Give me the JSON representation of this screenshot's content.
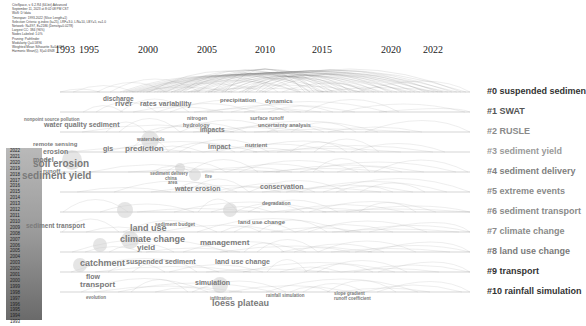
{
  "header": {
    "lines": [
      "CiteSpace, v. 6.2.R4 (64-bit) Advanced",
      "September 11, 2023 at 8:02:08 PM CST",
      "WoS: D:\\data",
      "Timespan: 1993-2022 (Slice Length=1)",
      "Selection Criteria: g-index (k=25), LRF=3.0, L/N=10, LBY=5, e=1.0",
      "Network: N=397, E=2186 (Density=0.0278)",
      "Largest CC: 384 (96%)",
      "Nodes Labeled: 1.0%",
      "Pruning: Pathfinder",
      "Modularity Q=0.5896",
      "Weighted Mean Silhouette S=0.8457",
      "Harmonic Mean(Q, S)=0.6948"
    ]
  },
  "timeline": {
    "years": [
      {
        "label": "1993",
        "x": 65
      },
      {
        "label": "1995",
        "x": 89
      },
      {
        "label": "2000",
        "x": 148
      },
      {
        "label": "2005",
        "x": 207
      },
      {
        "label": "2010",
        "x": 265
      },
      {
        "label": "2015",
        "x": 322
      },
      {
        "label": "2020",
        "x": 391
      },
      {
        "label": "2022",
        "x": 433
      }
    ]
  },
  "clusters": [
    {
      "label": "#0 suspended sedimen",
      "y": 92,
      "color": "#333333"
    },
    {
      "label": "#1 SWAT",
      "y": 112,
      "color": "#555555"
    },
    {
      "label": "#2 RUSLE",
      "y": 132,
      "color": "#8a8a8a"
    },
    {
      "label": "#3 sediment yield",
      "y": 152,
      "color": "#9a9a9a"
    },
    {
      "label": "#4 sediment delivery",
      "y": 172,
      "color": "#808080"
    },
    {
      "label": "#5 extreme events",
      "y": 192,
      "color": "#8a8a8a"
    },
    {
      "label": "#6 sediment transport",
      "y": 212,
      "color": "#8a8a8a"
    },
    {
      "label": "#7 climate change",
      "y": 232,
      "color": "#8a8a8a"
    },
    {
      "label": "#8 land use change",
      "y": 252,
      "color": "#7a7a7a"
    },
    {
      "label": "#9 transport",
      "y": 272,
      "color": "#333333"
    },
    {
      "label": "#10 rainfall simulation",
      "y": 292,
      "color": "#333333"
    }
  ],
  "legend": {
    "years": [
      "2022",
      "2021",
      "2020",
      "2019",
      "2018",
      "2017",
      "2016",
      "2015",
      "2014",
      "2013",
      "2012",
      "2011",
      "2010",
      "2009",
      "2008",
      "2007",
      "2006",
      "2005",
      "2004",
      "2003",
      "2002",
      "2001",
      "2000",
      "1999",
      "1998",
      "1997",
      "1996",
      "1995",
      "1994",
      "1993"
    ]
  },
  "keywords": [
    {
      "text": "discharge",
      "x": 103,
      "y": 101,
      "size": 6.5
    },
    {
      "text": "river",
      "x": 115,
      "y": 107,
      "size": 8
    },
    {
      "text": "rates variability",
      "x": 140,
      "y": 107,
      "size": 7
    },
    {
      "text": "precipitation",
      "x": 220,
      "y": 103,
      "size": 6
    },
    {
      "text": "dynamics",
      "x": 265,
      "y": 104,
      "size": 6
    },
    {
      "text": "nonpoint source pollution",
      "x": 24,
      "y": 121,
      "size": 4.5
    },
    {
      "text": "water quality sediment",
      "x": 44,
      "y": 128,
      "size": 7
    },
    {
      "text": "nitrogen",
      "x": 187,
      "y": 120,
      "size": 5
    },
    {
      "text": "surface runoff",
      "x": 250,
      "y": 120,
      "size": 5
    },
    {
      "text": "hydrology",
      "x": 183,
      "y": 127,
      "size": 5.5
    },
    {
      "text": "impacts",
      "x": 200,
      "y": 132,
      "size": 6.5
    },
    {
      "text": "uncertainty analysis",
      "x": 258,
      "y": 127,
      "size": 5.5
    },
    {
      "text": "watersheds",
      "x": 137,
      "y": 141,
      "size": 5
    },
    {
      "text": "remote sensing",
      "x": 33,
      "y": 147,
      "size": 6
    },
    {
      "text": "gis",
      "x": 103,
      "y": 152,
      "size": 7
    },
    {
      "text": "prediction",
      "x": 125,
      "y": 152,
      "size": 8
    },
    {
      "text": "erosion",
      "x": 43,
      "y": 155,
      "size": 7
    },
    {
      "text": "model",
      "x": 33,
      "y": 163,
      "size": 7
    },
    {
      "text": "soil erosion",
      "x": 33,
      "y": 168,
      "size": 10
    },
    {
      "text": "runoff",
      "x": 43,
      "y": 174,
      "size": 6
    },
    {
      "text": "sediment yield",
      "x": 22,
      "y": 180,
      "size": 10
    },
    {
      "text": "impact",
      "x": 208,
      "y": 150,
      "size": 7
    },
    {
      "text": "nutrient",
      "x": 245,
      "y": 148,
      "size": 6
    },
    {
      "text": "sediment delivery",
      "x": 150,
      "y": 175,
      "size": 4.5
    },
    {
      "text": "china",
      "x": 165,
      "y": 180,
      "size": 4.5
    },
    {
      "text": "area",
      "x": 168,
      "y": 184,
      "size": 4.5
    },
    {
      "text": "fire",
      "x": 205,
      "y": 178,
      "size": 4.5
    },
    {
      "text": "water erosion",
      "x": 175,
      "y": 192,
      "size": 7
    },
    {
      "text": "conservation",
      "x": 260,
      "y": 190,
      "size": 7
    },
    {
      "text": "degradation",
      "x": 262,
      "y": 205,
      "size": 5
    },
    {
      "text": "sediment transport",
      "x": 26,
      "y": 228,
      "size": 6.5
    },
    {
      "text": "land use",
      "x": 130,
      "y": 232,
      "size": 9
    },
    {
      "text": "sediment budget",
      "x": 155,
      "y": 226,
      "size": 5
    },
    {
      "text": "land use change",
      "x": 238,
      "y": 225,
      "size": 6
    },
    {
      "text": "climate change",
      "x": 120,
      "y": 243,
      "size": 9
    },
    {
      "text": "yield",
      "x": 137,
      "y": 251,
      "size": 8
    },
    {
      "text": "management",
      "x": 200,
      "y": 246,
      "size": 8
    },
    {
      "text": "catchment",
      "x": 80,
      "y": 267,
      "size": 9
    },
    {
      "text": "suspended sediment",
      "x": 126,
      "y": 265,
      "size": 7
    },
    {
      "text": "land use change",
      "x": 215,
      "y": 265,
      "size": 7
    },
    {
      "text": "flow",
      "x": 86,
      "y": 280,
      "size": 7
    },
    {
      "text": "transport",
      "x": 80,
      "y": 288,
      "size": 8
    },
    {
      "text": "simulation",
      "x": 195,
      "y": 286,
      "size": 7
    },
    {
      "text": "evolution",
      "x": 86,
      "y": 299,
      "size": 4.5
    },
    {
      "text": "infiltration",
      "x": 210,
      "y": 300,
      "size": 4.5
    },
    {
      "text": "loess plateau",
      "x": 212,
      "y": 307,
      "size": 9
    },
    {
      "text": "rainfall simulation",
      "x": 266,
      "y": 297,
      "size": 4.5
    },
    {
      "text": "slope gradient",
      "x": 334,
      "y": 295,
      "size": 4.5
    },
    {
      "text": "runoff coefficient",
      "x": 334,
      "y": 300,
      "size": 4.5
    }
  ]
}
